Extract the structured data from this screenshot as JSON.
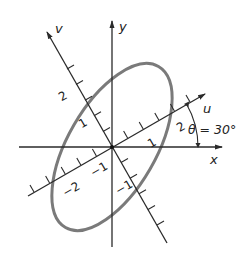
{
  "diagram": {
    "type": "rotated-coordinate-axes-with-ellipse",
    "axes": {
      "x": {
        "label": "x"
      },
      "y": {
        "label": "y"
      },
      "u": {
        "label": "u"
      },
      "v": {
        "label": "v"
      }
    },
    "angle_label": "θ = 30°",
    "u_tick_labels": {
      "pos1": "1",
      "pos2": "2",
      "neg1": "−1",
      "neg2": "−2"
    },
    "v_tick_labels": {
      "pos1": "1",
      "pos2": "2",
      "neg1": "−1"
    },
    "ellipse": {
      "semi_major_axis": "along v",
      "semi_minor_axis": "along u",
      "rotation_deg": 30
    },
    "colors": {
      "axes": "#2a2a2a",
      "ellipse": "#7a7a7a"
    }
  }
}
